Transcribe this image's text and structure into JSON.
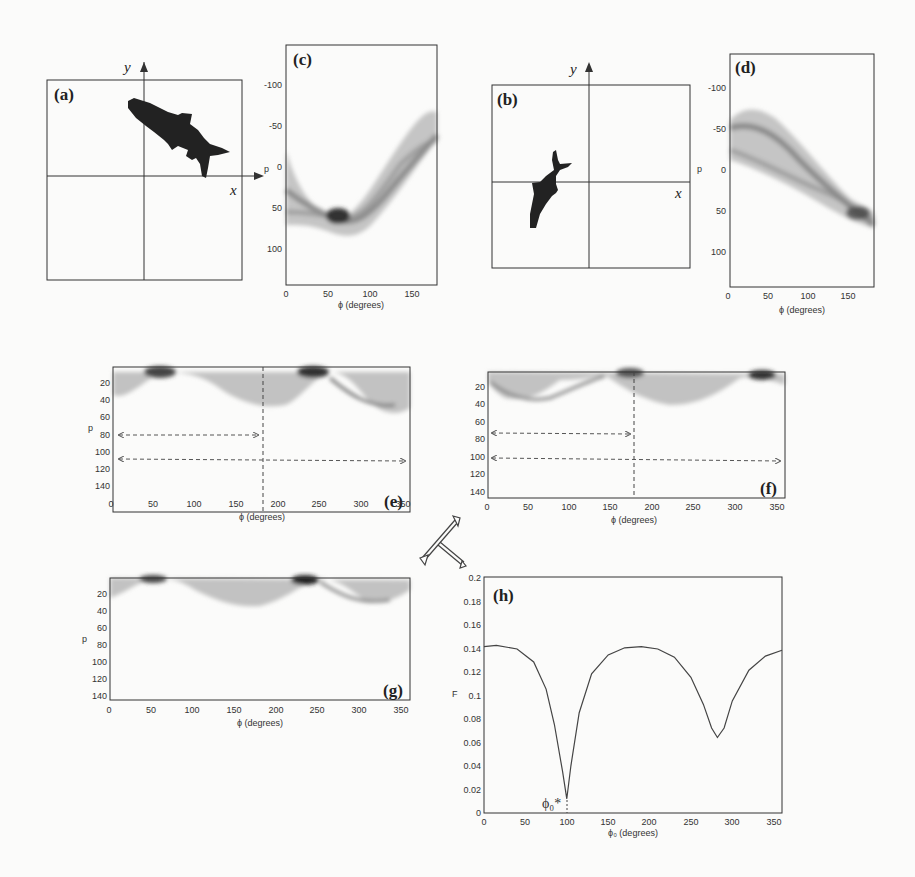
{
  "figure": {
    "caption_fragment": "Fig. 5 ..."
  },
  "panels": {
    "a": {
      "label": "(a)",
      "x_axis": "x",
      "y_axis": "y",
      "content": "fish silhouette (rotated, upper-right quadrant)"
    },
    "b": {
      "label": "(b)",
      "x_axis": "x",
      "y_axis": "y",
      "content": "fish silhouette (rotated, lower-left quadrant)"
    },
    "c": {
      "label": "(c)",
      "xlabel": "ϕ (degrees)",
      "ylabel": "p",
      "xticks": [
        "0",
        "50",
        "100",
        "150"
      ],
      "yticks": [
        "-100",
        "-50",
        "0",
        "50",
        "100"
      ]
    },
    "d": {
      "label": "(d)",
      "xlabel": "ϕ (degrees)",
      "ylabel": "p",
      "xticks": [
        "0",
        "50",
        "100",
        "150"
      ],
      "yticks": [
        "-100",
        "-50",
        "0",
        "50",
        "100"
      ]
    },
    "e": {
      "label": "(e)",
      "xlabel": "ϕ (degrees)",
      "ylabel": "p",
      "xticks": [
        "0",
        "50",
        "100",
        "150",
        "200",
        "250",
        "300",
        "350"
      ],
      "yticks": [
        "20",
        "40",
        "60",
        "80",
        "100",
        "120",
        "140"
      ]
    },
    "f": {
      "label": "(f)",
      "xlabel": "ϕ (degrees)",
      "ylabel": "p",
      "xticks": [
        "0",
        "50",
        "100",
        "150",
        "200",
        "250",
        "300",
        "350"
      ],
      "yticks": [
        "20",
        "40",
        "60",
        "80",
        "100",
        "120",
        "140"
      ]
    },
    "g": {
      "label": "(g)",
      "xlabel": "ϕ (degrees)",
      "ylabel": "p",
      "xticks": [
        "0",
        "50",
        "100",
        "150",
        "200",
        "250",
        "300",
        "350"
      ],
      "yticks": [
        "20",
        "40",
        "60",
        "80",
        "100",
        "120",
        "140"
      ]
    },
    "h": {
      "label": "(h)",
      "xlabel": "ϕ₀ (degrees)",
      "ylabel": "F",
      "xticks": [
        "0",
        "50",
        "100",
        "150",
        "200",
        "250",
        "300",
        "350"
      ],
      "yticks": [
        "0",
        "0.02",
        "0.04",
        "0.06",
        "0.08",
        "0.1",
        "0.12",
        "0.14",
        "0.16",
        "0.18",
        "0.2"
      ],
      "annotation": "ϕ₀*"
    }
  },
  "chart_data": [
    {
      "type": "heatmap",
      "title": "(c) Radon-type sinogram of fish (a)",
      "xlabel": "ϕ (degrees)",
      "ylabel": "p",
      "xlim": [
        0,
        180
      ],
      "ylim": [
        -140,
        140
      ],
      "ridge_minimum": {
        "phi": 55,
        "p": 55
      }
    },
    {
      "type": "heatmap",
      "title": "(d) Radon-type sinogram of fish (b)",
      "xlabel": "ϕ (degrees)",
      "ylabel": "p",
      "xlim": [
        0,
        180
      ],
      "ylim": [
        -140,
        140
      ],
      "ridge_convergence": {
        "phi": 165,
        "p": 45
      }
    },
    {
      "type": "heatmap",
      "title": "(e) extended sinogram",
      "xlabel": "ϕ (degrees)",
      "ylabel": "p",
      "xlim": [
        0,
        360
      ],
      "ylim": [
        0,
        145
      ],
      "dark_peaks_phi": [
        55,
        235
      ],
      "divider_phi": 180,
      "arrows_p": [
        80,
        110
      ]
    },
    {
      "type": "heatmap",
      "title": "(f) extended sinogram",
      "xlabel": "ϕ (degrees)",
      "ylabel": "p",
      "xlim": [
        0,
        360
      ],
      "ylim": [
        0,
        145
      ],
      "dark_peaks_phi": [
        165,
        345
      ],
      "divider_phi": 180,
      "arrows_p": [
        72,
        103
      ]
    },
    {
      "type": "heatmap",
      "title": "(g) aligned sinogram",
      "xlabel": "ϕ (degrees)",
      "ylabel": "p",
      "xlim": [
        0,
        360
      ],
      "ylim": [
        0,
        145
      ],
      "dark_peaks_phi": [
        55,
        235
      ]
    },
    {
      "type": "line",
      "title": "(h)",
      "xlabel": "ϕ₀ (degrees)",
      "ylabel": "F",
      "xlim": [
        0,
        360
      ],
      "ylim": [
        0,
        0.2
      ],
      "grid": false,
      "x": [
        0,
        15,
        40,
        60,
        75,
        85,
        95,
        100,
        105,
        115,
        130,
        150,
        170,
        190,
        210,
        230,
        250,
        265,
        275,
        282,
        290,
        300,
        320,
        340,
        360
      ],
      "y": [
        0.141,
        0.142,
        0.139,
        0.128,
        0.105,
        0.075,
        0.035,
        0.012,
        0.04,
        0.085,
        0.118,
        0.134,
        0.14,
        0.141,
        0.139,
        0.132,
        0.115,
        0.092,
        0.072,
        0.064,
        0.072,
        0.095,
        0.121,
        0.133,
        0.138
      ],
      "annotations": [
        {
          "text": "ϕ₀*",
          "x": 100,
          "y": 0
        }
      ]
    }
  ]
}
